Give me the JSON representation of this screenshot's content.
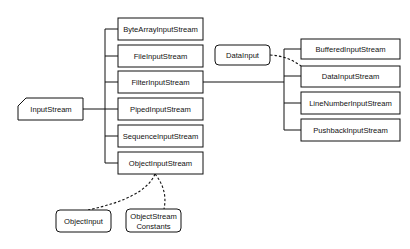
{
  "diagram": {
    "type": "class-hierarchy",
    "root": {
      "label": "InputStream"
    },
    "level1": [
      {
        "label": "ByteArrayInputStream"
      },
      {
        "label": "FileInputStream"
      },
      {
        "label": "FilterInputStream"
      },
      {
        "label": "PipedInputStream"
      },
      {
        "label": "SequenceInputStream"
      },
      {
        "label": "ObjectInputStream"
      }
    ],
    "filter_children": [
      {
        "label": "BufferedInputStream"
      },
      {
        "label": "DataInputStream"
      },
      {
        "label": "LineNumberInputStream"
      },
      {
        "label": "PushbackInputStream"
      }
    ],
    "interfaces": {
      "data_input": {
        "label": "DataInput"
      },
      "object_input": {
        "label": "ObjectInput"
      },
      "object_stream_constants": {
        "line1": "ObjectStream",
        "line2": "Constants"
      }
    },
    "colors": {
      "stroke": "#111111",
      "background": "#ffffff"
    }
  }
}
